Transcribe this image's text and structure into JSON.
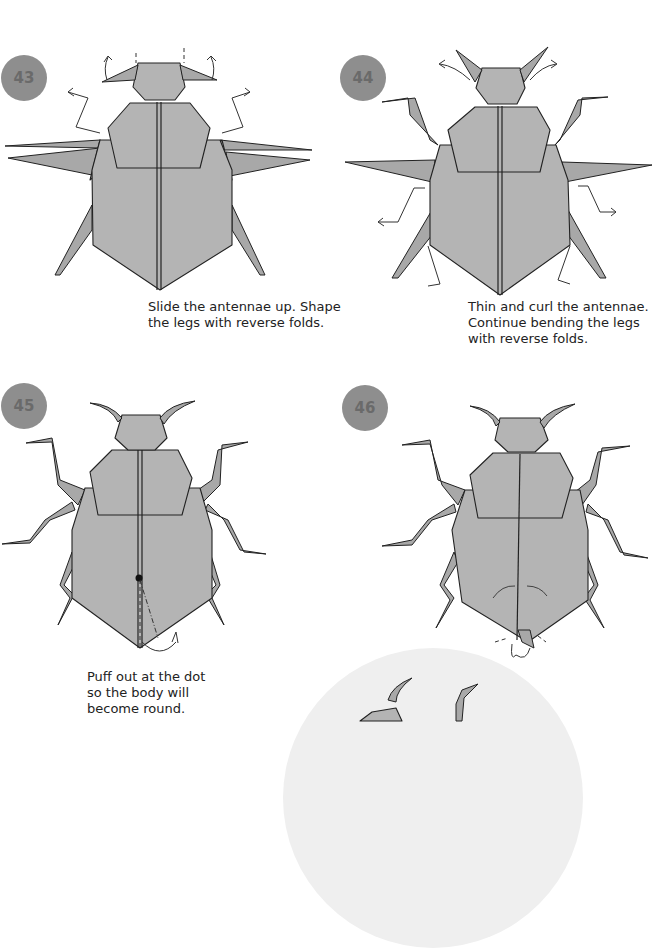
{
  "page": {
    "background": "#ffffff",
    "paper_color": "#b4b4b4",
    "badge_color": "#8e8e8e"
  },
  "steps": [
    {
      "number": "43",
      "caption_lines": [
        "Slide the antennae up. Shape",
        "the legs with reverse folds."
      ]
    },
    {
      "number": "44",
      "caption_lines": [
        "Thin and curl the antennae.",
        "Continue bending the legs",
        "with reverse folds."
      ]
    },
    {
      "number": "45",
      "caption_lines": [
        "Puff out at the dot",
        "so the body will",
        "become round."
      ]
    },
    {
      "number": "46",
      "caption_lines": []
    }
  ],
  "final_preview": {
    "icon": "finished-beetle-preview"
  }
}
